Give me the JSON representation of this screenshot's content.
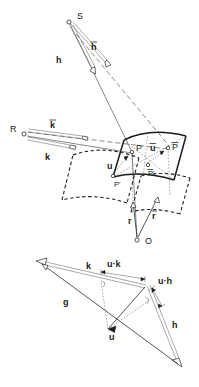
{
  "figure": {
    "background_color": "#ffffff",
    "ink_color": "#1c1c1c",
    "width": 199,
    "height": 387
  },
  "upper_diagram": {
    "name": "scattering-geometry",
    "points": [
      {
        "id": "S",
        "label": "S",
        "kind": "open-circle",
        "x": 69,
        "y": 22,
        "label_x": 77,
        "label_y": 19
      },
      {
        "id": "R",
        "label": "R",
        "kind": "open-circle",
        "x": 24,
        "y": 134,
        "label_x": 10,
        "label_y": 132
      },
      {
        "id": "O",
        "label": "O",
        "kind": "open-circle",
        "x": 137,
        "y": 240,
        "label_x": 145,
        "label_y": 244
      },
      {
        "id": "P",
        "label": "P",
        "kind": "open-circle",
        "x": 132,
        "y": 152,
        "label_x": 136,
        "label_y": 151
      },
      {
        "id": "Pbar",
        "label": "P",
        "kind": "open-circle",
        "x": 168,
        "y": 148,
        "label_x": 172,
        "label_y": 150,
        "overbar": true
      },
      {
        "id": "Pprime",
        "label": "P'",
        "kind": "open-circle",
        "x": 113,
        "y": 176,
        "label_x": 114,
        "label_y": 186
      },
      {
        "id": "Pbarprime",
        "label": "P'",
        "kind": "open-circle",
        "x": 148,
        "y": 165,
        "label_x": 148,
        "label_y": 175,
        "overbar": true
      }
    ],
    "vectors": [
      {
        "id": "h",
        "label": "h",
        "bold": true,
        "overbar": false,
        "label_x": 56,
        "label_y": 60,
        "from": "S",
        "style": "double-line"
      },
      {
        "id": "hbar",
        "label": "h",
        "bold": true,
        "overbar": true,
        "label_x": 91,
        "label_y": 47,
        "from": "S",
        "style": "double-line"
      },
      {
        "id": "k",
        "label": "k",
        "bold": true,
        "overbar": false,
        "label_x": 45,
        "label_y": 157,
        "from": "R",
        "style": "double-line"
      },
      {
        "id": "kbar",
        "label": "k",
        "bold": true,
        "overbar": true,
        "label_x": 50,
        "label_y": 125,
        "from": "R",
        "style": "double-line"
      },
      {
        "id": "r",
        "label": "r",
        "bold": true,
        "overbar": false,
        "label_x": 128,
        "label_y": 221,
        "from": "O",
        "style": "single-line"
      },
      {
        "id": "rbar",
        "label": "r",
        "bold": true,
        "overbar": true,
        "label_x": 152,
        "label_y": 216,
        "from": "O",
        "style": "single-line"
      },
      {
        "id": "u",
        "label": "u",
        "bold": true,
        "overbar": false,
        "label_x": 110,
        "label_y": 166,
        "from": "P",
        "style": "single-line"
      },
      {
        "id": "ubar",
        "label": "u",
        "bold": true,
        "overbar": true,
        "label_x": 150,
        "label_y": 148,
        "from": "Pbar",
        "style": "single-line"
      }
    ],
    "surfaces": [
      {
        "id": "upper-patch",
        "style": "solid",
        "note": "curved crystal surface patch through P and P-bar"
      },
      {
        "id": "lower-patch",
        "style": "dashed",
        "note": "projected / reference curved patch through P' and P-bar'"
      }
    ],
    "rays": [
      {
        "id": "ray-S-P",
        "from": "S",
        "to": "P",
        "style": "solid"
      },
      {
        "id": "ray-S-Pbar",
        "from": "S",
        "to": "Pbar",
        "style": "dashed"
      },
      {
        "id": "ray-R-P",
        "from": "R",
        "to": "P",
        "style": "solid"
      },
      {
        "id": "ray-R-Pbar",
        "from": "R",
        "to": "Pbar",
        "style": "dashed"
      }
    ]
  },
  "lower_diagram": {
    "name": "vector-triangle",
    "vectors": [
      {
        "id": "k",
        "label": "k",
        "bold": true,
        "label_x": 86,
        "label_y": 266,
        "style": "double-line",
        "arrowhead": "open"
      },
      {
        "id": "g",
        "label": "g",
        "bold": true,
        "label_x": 63,
        "label_y": 302,
        "style": "single-line",
        "arrowhead": "open"
      },
      {
        "id": "h",
        "label": "h",
        "bold": true,
        "label_x": 172,
        "label_y": 325,
        "style": "double-line",
        "arrowhead": "open"
      },
      {
        "id": "u",
        "label": "u",
        "bold": true,
        "label_x": 112,
        "label_y": 335,
        "style": "single-line",
        "arrowhead": "filled"
      }
    ],
    "projections": [
      {
        "id": "u-dot-k",
        "label": "u·k",
        "label_x": 117,
        "label_y": 266,
        "note": "projection of u onto k"
      },
      {
        "id": "u-dot-h",
        "label": "u·h",
        "label_x": 158,
        "label_y": 281,
        "note": "projection of u onto h"
      }
    ],
    "angle_marks": [
      {
        "id": "right-angle-k",
        "note": "right angle between u and k at foot of projection"
      },
      {
        "id": "right-angle-h",
        "note": "right angle between u and h at foot of projection"
      }
    ]
  }
}
